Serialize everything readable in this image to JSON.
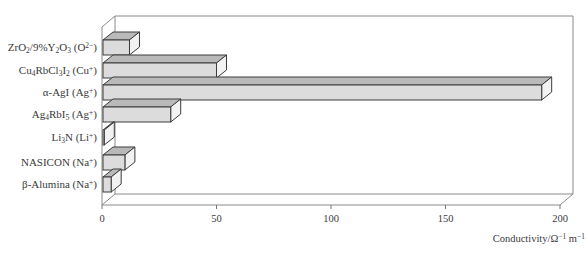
{
  "chart_data": {
    "type": "bar",
    "orientation": "horizontal",
    "style": "3d",
    "title": "",
    "xlabel": "Conductivity/Ω⁻¹m⁻¹",
    "ylabel": "",
    "xlim": [
      0,
      200
    ],
    "xticks": [
      0,
      50,
      100,
      150,
      200
    ],
    "grid": false,
    "legend": null,
    "categories": [
      "ZrO2/9%Y2O3 (O2−)",
      "Cu4RbCl3I2 (Cu+)",
      "α-AgI (Ag+)",
      "Ag4RbI5 (Ag+)",
      "Li3N (Li+)",
      "NASICON (Na+)",
      "β-Alumina (Na+)"
    ],
    "values": [
      12,
      50,
      192,
      30,
      1,
      10,
      4
    ],
    "bar_colors": {
      "front": "#dcdcdc",
      "top": "#b9b9b9",
      "side": "#f2f2f2",
      "outline": "#3c3c3c"
    }
  },
  "labels": {
    "categories": [
      {
        "parts": [
          [
            "ZrO",
            ""
          ],
          [
            "2",
            "sub"
          ],
          [
            "/9%Y",
            ""
          ],
          [
            "2",
            "sub"
          ],
          [
            "O",
            ""
          ],
          [
            "3",
            "sub"
          ],
          [
            " (O",
            ""
          ],
          [
            "2−",
            "sup"
          ],
          [
            ")",
            ""
          ]
        ]
      },
      {
        "parts": [
          [
            "Cu",
            ""
          ],
          [
            "4",
            "sub"
          ],
          [
            "RbCl",
            ""
          ],
          [
            "3",
            "sub"
          ],
          [
            "I",
            ""
          ],
          [
            "2",
            "sub"
          ],
          [
            " (Cu",
            ""
          ],
          [
            "+",
            "sup"
          ],
          [
            ")",
            ""
          ]
        ]
      },
      {
        "parts": [
          [
            "α-AgI (Ag",
            ""
          ],
          [
            "+",
            "sup"
          ],
          [
            ")",
            ""
          ]
        ]
      },
      {
        "parts": [
          [
            "Ag",
            ""
          ],
          [
            "4",
            "sub"
          ],
          [
            "RbI",
            ""
          ],
          [
            "5",
            "sub"
          ],
          [
            " (Ag",
            ""
          ],
          [
            "+",
            "sup"
          ],
          [
            ")",
            ""
          ]
        ]
      },
      {
        "parts": [
          [
            "Li",
            ""
          ],
          [
            "3",
            "sub"
          ],
          [
            "N (Li",
            ""
          ],
          [
            "+",
            "sup"
          ],
          [
            ")",
            ""
          ]
        ]
      },
      {
        "parts": [
          [
            "NASICON (Na",
            ""
          ],
          [
            "+",
            "sup"
          ],
          [
            ")",
            ""
          ]
        ]
      },
      {
        "parts": [
          [
            "β-Alumina (Na",
            ""
          ],
          [
            "+",
            "sup"
          ],
          [
            ")",
            ""
          ]
        ]
      }
    ],
    "tick_labels": [
      "0",
      "50",
      "100",
      "150",
      "200"
    ],
    "axis_title": {
      "main": "Conductivity/Ω",
      "sup1": "−1",
      "mid": " m",
      "sup2": "−1"
    }
  }
}
